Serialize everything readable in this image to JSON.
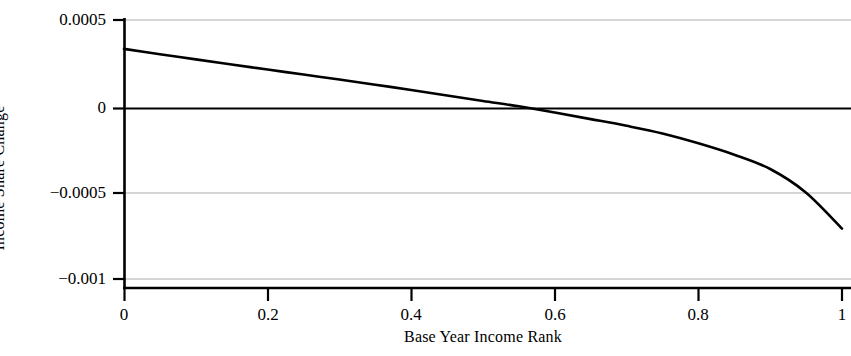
{
  "chart_data": {
    "type": "line",
    "title": "",
    "xlabel": "Base Year Income Rank",
    "ylabel": "Income Share Change",
    "xlim": [
      0,
      1
    ],
    "ylim": [
      -0.001,
      0.0005
    ],
    "xticks": [
      "0",
      "0.2",
      "0.4",
      "0.6",
      "0.8",
      "1"
    ],
    "xtick_values": [
      0,
      0.2,
      0.4,
      0.6,
      0.8,
      1
    ],
    "yticks": [
      "0.0005",
      "0",
      "−0.0005",
      "−0.001"
    ],
    "ytick_values": [
      0.0005,
      0,
      -0.0005,
      -0.001
    ],
    "grid": "horizontal gridlines at y = 0.0005, -0.0005, -0.001 (light gray); solid black reference line at y = 0",
    "legend": "none",
    "zero_crossing_x": 0.55,
    "series": [
      {
        "name": "Income Share Change",
        "color": "#000000",
        "x": [
          0.0,
          0.05,
          0.1,
          0.15,
          0.2,
          0.25,
          0.3,
          0.35,
          0.4,
          0.45,
          0.5,
          0.55,
          0.6,
          0.65,
          0.7,
          0.75,
          0.8,
          0.85,
          0.9,
          0.95,
          1.0
        ],
        "y": [
          0.000333,
          0.000302,
          0.000272,
          0.000242,
          0.000213,
          0.000184,
          0.000155,
          0.000125,
          9.5e-05,
          6.3e-05,
          3.1e-05,
          0.0,
          -3.6e-05,
          -7.4e-05,
          -0.000113,
          -0.000157,
          -0.000214,
          -0.00028,
          -0.000363,
          -0.0005,
          -0.000708
        ]
      }
    ]
  },
  "axes": {
    "y_title": "Income Share Change",
    "x_title": "Base Year Income Rank",
    "y_tick_labels": [
      "0.0005",
      "0",
      "−0.0005",
      "−0.001"
    ],
    "x_tick_labels": [
      "0",
      "0.2",
      "0.4",
      "0.6",
      "0.8",
      "1"
    ]
  },
  "colors": {
    "curve": "#111111",
    "axis": "#000000",
    "gridline": "#c9c9c9",
    "zero_line": "#000000",
    "background": "#ffffff"
  }
}
